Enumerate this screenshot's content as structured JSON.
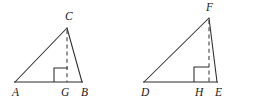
{
  "figure": {
    "background_color": "#ffffff",
    "stroke_color": "#2b2b2b",
    "label_color": "#1a1a1a",
    "triangles": [
      {
        "name": "triangle-abc",
        "vertices": {
          "left": {
            "label": "A",
            "x": 15,
            "y": 82,
            "label_x": 12,
            "label_y": 96
          },
          "right": {
            "label": "B",
            "x": 82,
            "y": 82,
            "label_x": 81,
            "label_y": 96
          },
          "apex": {
            "label": "C",
            "x": 67,
            "y": 28,
            "label_x": 65,
            "label_y": 20
          }
        },
        "foot": {
          "label": "G",
          "x": 67,
          "y": 82,
          "label_x": 61,
          "label_y": 96
        },
        "altitude_dashed": true,
        "right_angle_marker": {
          "x": 54,
          "y": 68,
          "size": 14,
          "side": "left"
        }
      },
      {
        "name": "triangle-def",
        "vertices": {
          "left": {
            "label": "D",
            "x": 144,
            "y": 82,
            "label_x": 141,
            "label_y": 96
          },
          "right": {
            "label": "E",
            "x": 217,
            "y": 82,
            "label_x": 215,
            "label_y": 96
          },
          "apex": {
            "label": "F",
            "x": 209,
            "y": 18,
            "label_x": 206,
            "label_y": 11
          }
        },
        "foot": {
          "label": "H",
          "x": 209,
          "y": 82,
          "label_x": 195,
          "label_y": 96
        },
        "altitude_dashed": true,
        "right_angle_marker": {
          "x": 194,
          "y": 67,
          "size": 15,
          "side": "left"
        }
      }
    ]
  }
}
